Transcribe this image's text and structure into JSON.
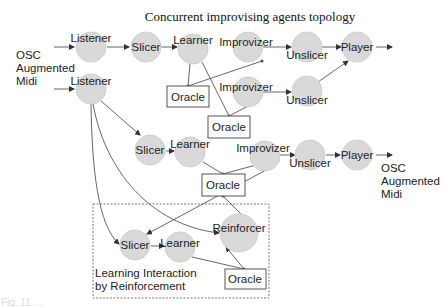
{
  "title": "Concurrent improvising agents topology",
  "io_labels": {
    "input": [
      "OSC",
      "Augmented",
      "Midi"
    ],
    "output": [
      "OSC",
      "Augmented",
      "Midi"
    ]
  },
  "group": {
    "label_line1": "Learning Interaction",
    "label_line2": "by Reinforcement"
  },
  "nodes": {
    "listener1": "Listener",
    "slicer1": "Slicer",
    "learner1": "Learner",
    "improvizer1": "Improvizer",
    "unslicer1": "Unslicer",
    "player1": "Player",
    "oracle1": "Oracle",
    "improvizer2": "Improvizer",
    "unslicer2": "Unslicer",
    "oracle2": "Oracle",
    "listener2": "Listener",
    "slicer2": "Slicer",
    "learner2": "Learner",
    "improvizer3": "Improvizer",
    "unslicer3": "Unslicer",
    "player3": "Player",
    "oracle3": "Oracle",
    "reinforcer": "Reinforcer",
    "slicer3": "Slicer",
    "learner3": "Learner",
    "oracle4": "Oracle"
  },
  "caption": "Fig. 11 ..."
}
